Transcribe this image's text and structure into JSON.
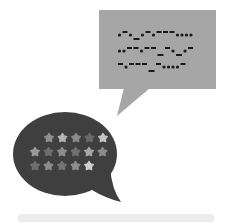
{
  "illustration": {
    "description": "Two speech bubbles: gray square bubble with morse-like code, dark oval bubble with stars",
    "colors": {
      "background": "#ffffff",
      "square_bubble": "#a6a6a6",
      "code_mark": "#1a1a1a",
      "oval_bubble": "#3f3f3f",
      "bottom_bar": "#ececec"
    },
    "square_bubble": {
      "code_lines": [
        ".-._.-.---....",
        "..--.--_-._.-",
        "-.---_-....-"
      ]
    },
    "oval_bubble": {
      "star_rows": [
        [
          "#8f8f8f",
          "#b5b5b5",
          "#8a8a8a",
          "#6a6a6a",
          "#c4c4c4"
        ],
        [
          "#9a9a9a",
          "#6e6e6e",
          "#8d8d8d",
          "#707070",
          "#a8a8a8",
          "#8c8c8c"
        ],
        [
          "#6f6f6f",
          "#8c8c8c",
          "#747474",
          "#8e8e8e",
          "#d0d0d0"
        ]
      ]
    }
  }
}
